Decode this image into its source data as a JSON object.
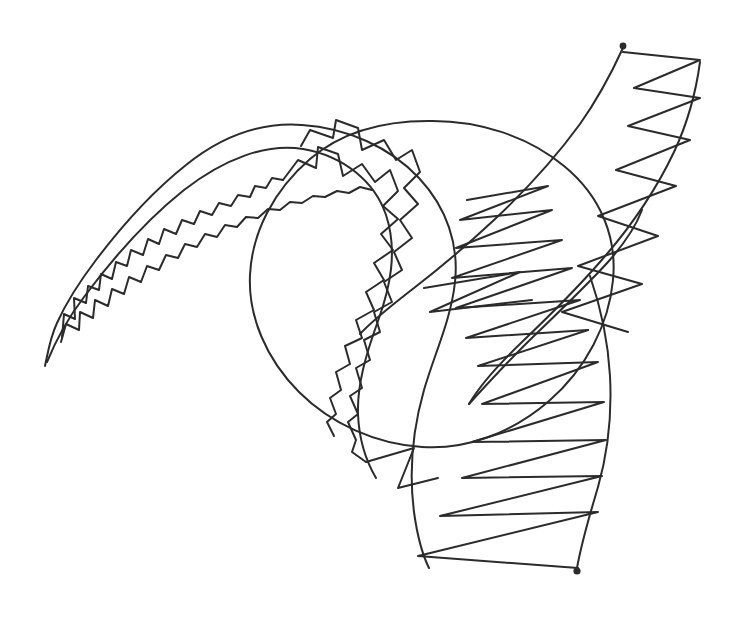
{
  "canvas": {
    "width": 733,
    "height": 622,
    "background_color": "#ffffff",
    "ink_color": "#2b2b2b",
    "stroke_width": 2,
    "stroke_width_thin": 1.8,
    "medium": "pen-on-paper line drawing",
    "title": "Abstract Ribbon and Circle Sketch"
  },
  "shapes": {
    "circle": {
      "name": "large-circle-outline",
      "cx": 428,
      "cy": 284,
      "rx": 186,
      "ry": 163,
      "rotation": -8,
      "note": "single continuous hand-drawn circle, slightly oval, crossing the ribbon"
    },
    "ribbon": {
      "name": "tapering-ribbon-band",
      "note": "S-curving band, pointed at lower-left tail, widening to the right and bottom, with a second lobe sweeping up to the top-right",
      "outer_edge": "M45,366 C49,340 55,318 70,296 C96,256 132,208 175,174 C215,142 258,126 300,128 C352,131 398,150 429,185 C455,215 463,249 458,283 C452,322 434,358 425,393 C415,433 412,473 417,512 C421,543 426,558 430,567",
      "inner_edge": "M47,364 C58,336 72,310 92,285 C126,243 168,198 214,170 C258,144 300,136 336,147 C378,160 406,190 412,228 C418,268 405,305 392,340 C378,378 370,412 373,447",
      "tail_tip": {
        "x": 45,
        "y": 366
      },
      "mouth_tip": {
        "x": 430,
        "y": 567
      }
    },
    "upper_right_lobe": {
      "name": "upper-right-band",
      "left_edge": "M430,282 C466,254 505,212 545,170 C578,136 605,100 622,56",
      "right_edge": "M468,320 C512,290 556,250 595,206 C640,156 672,110 700,70 C706,62 706,58 700,58"
    },
    "endpoints": [
      {
        "name": "start-dot-top-right",
        "x": 623,
        "y": 46,
        "r": 3.4
      },
      {
        "name": "end-dot-bottom",
        "x": 577,
        "y": 571,
        "r": 3.6
      },
      {
        "name": "tail-point-left",
        "x": 45,
        "y": 366,
        "r": 0
      }
    ],
    "zigzag": {
      "name": "zigzag-hatching",
      "note": "continuous zigzag filling the ribbon; amplitude grows from a few px at the left tail to ~130px at the wide right section",
      "segment_count_small": 22,
      "segment_count_large": 14
    }
  },
  "labels": {
    "none_visible": ""
  }
}
